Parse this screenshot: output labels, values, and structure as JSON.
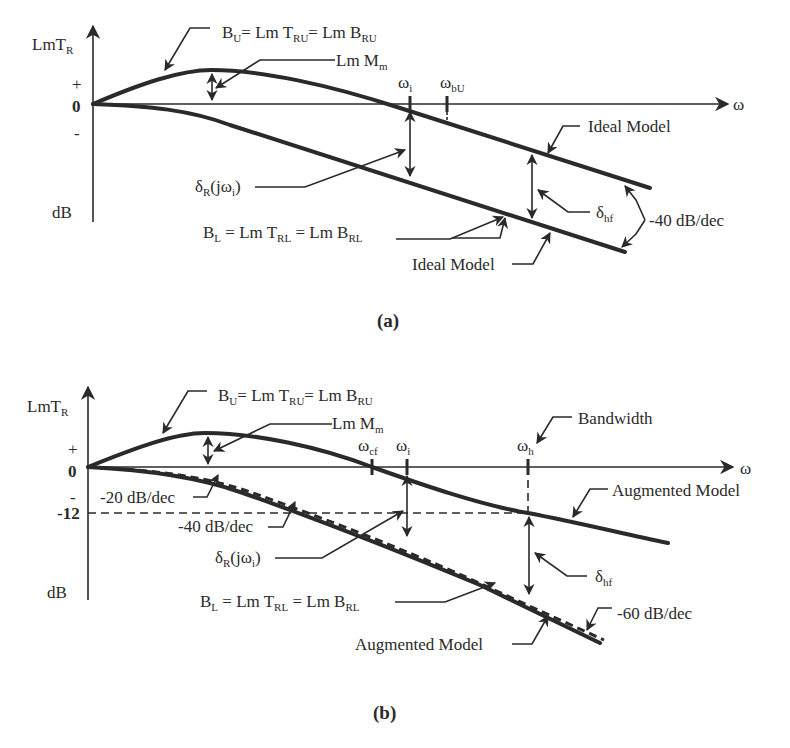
{
  "figure_a": {
    "caption": "(a)",
    "y_axis_label": "LmT",
    "y_axis_label_sub": "R",
    "y_axis_unit": "dB",
    "x_axis_label": "ω",
    "y_ticks": [
      "+",
      "0",
      "-"
    ],
    "upper_bound": {
      "main": "B",
      "sub1": "U",
      "eq1": "= Lm T",
      "sub2": "RU",
      "eq2": "= Lm B",
      "sub3": "RU"
    },
    "lower_bound": {
      "main": "B",
      "sub1": "L",
      "eq1": " = Lm T",
      "sub2": "RL",
      "eq2": " = Lm B",
      "sub3": "RL"
    },
    "peak_label": {
      "main": "Lm M",
      "sub": "m"
    },
    "omega_i": {
      "main": "ω",
      "sub": "i"
    },
    "omega_bu": {
      "main": "ω",
      "sub": "bU"
    },
    "delta_r": {
      "main": "δ",
      "sub": "R",
      "rest": "(jω",
      "sub2": "i",
      "close": ")"
    },
    "delta_hf": {
      "main": "δ",
      "sub": "hf"
    },
    "ideal_model_upper": "Ideal Model",
    "ideal_model_lower": "Ideal Model",
    "slope": "-40 dB/dec"
  },
  "figure_b": {
    "caption": "(b)",
    "y_axis_label": "LmT",
    "y_axis_label_sub": "R",
    "y_axis_unit": "dB",
    "x_axis_label": "ω",
    "y_ticks": [
      "+",
      "0",
      "-",
      "-12"
    ],
    "upper_bound": {
      "main": "B",
      "sub1": "U",
      "eq1": "= Lm T",
      "sub2": "RU",
      "eq2": "= Lm B",
      "sub3": "RU"
    },
    "lower_bound": {
      "main": "B",
      "sub1": "L",
      "eq1": " = Lm T",
      "sub2": "RL",
      "eq2": " = Lm B",
      "sub3": "RL"
    },
    "peak_label": {
      "main": "Lm M",
      "sub": "m"
    },
    "omega_cf": {
      "main": "ω",
      "sub": "cf"
    },
    "omega_i": {
      "main": "ω",
      "sub": "i"
    },
    "omega_h": {
      "main": "ω",
      "sub": "h"
    },
    "bandwidth": "Bandwidth",
    "delta_r": {
      "main": "δ",
      "sub": "R",
      "rest": "(jω",
      "sub2": "i",
      "close": ")"
    },
    "delta_hf": {
      "main": "δ",
      "sub": "hf"
    },
    "augmented_model_upper": "Augmented Model",
    "augmented_model_lower": "Augmented Model",
    "slope_20": "-20 dB/dec",
    "slope_40": "-40 dB/dec",
    "slope_60": "-60 dB/dec"
  }
}
